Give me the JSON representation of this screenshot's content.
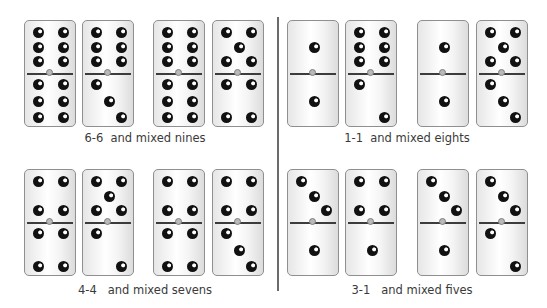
{
  "colors": {
    "divider": "#6b6b6b",
    "pip": "#111111",
    "caption": "#3a3a3a"
  },
  "groups": [
    {
      "caption": "6-6  and mixed nines",
      "caption_pos": {
        "x": 75,
        "y": 131,
        "w": 140
      },
      "dominoes": [
        {
          "x": 24,
          "y": 20,
          "top": 6,
          "bottom": 6
        },
        {
          "x": 82,
          "y": 20,
          "top": 6,
          "bottom": 3
        },
        {
          "x": 153,
          "y": 20,
          "top": 6,
          "bottom": 6
        },
        {
          "x": 212,
          "y": 20,
          "top": 5,
          "bottom": 4
        }
      ]
    },
    {
      "caption": "1-1  and mixed eights",
      "caption_pos": {
        "x": 337,
        "y": 131,
        "w": 140
      },
      "dominoes": [
        {
          "x": 287,
          "y": 20,
          "top": 1,
          "bottom": 1
        },
        {
          "x": 345,
          "y": 20,
          "top": 6,
          "bottom": 2
        },
        {
          "x": 417,
          "y": 20,
          "top": 1,
          "bottom": 1
        },
        {
          "x": 476,
          "y": 20,
          "top": 5,
          "bottom": 3
        }
      ]
    },
    {
      "caption": "4-4   and mixed sevens",
      "caption_pos": {
        "x": 70,
        "y": 283,
        "w": 150
      },
      "dominoes": [
        {
          "x": 24,
          "y": 169,
          "top": 4,
          "bottom": 4
        },
        {
          "x": 82,
          "y": 169,
          "top": 5,
          "bottom": 2
        },
        {
          "x": 153,
          "y": 169,
          "top": 4,
          "bottom": 4
        },
        {
          "x": 212,
          "y": 169,
          "top": 4,
          "bottom": 3
        }
      ]
    },
    {
      "caption": "3-1   and mixed fives",
      "caption_pos": {
        "x": 342,
        "y": 283,
        "w": 140
      },
      "dominoes": [
        {
          "x": 287,
          "y": 169,
          "top": 3,
          "bottom": 1
        },
        {
          "x": 345,
          "y": 169,
          "top": 4,
          "bottom": 1
        },
        {
          "x": 417,
          "y": 169,
          "top": 3,
          "bottom": 1
        },
        {
          "x": 476,
          "y": 169,
          "top": 3,
          "bottom": 2
        }
      ]
    }
  ]
}
